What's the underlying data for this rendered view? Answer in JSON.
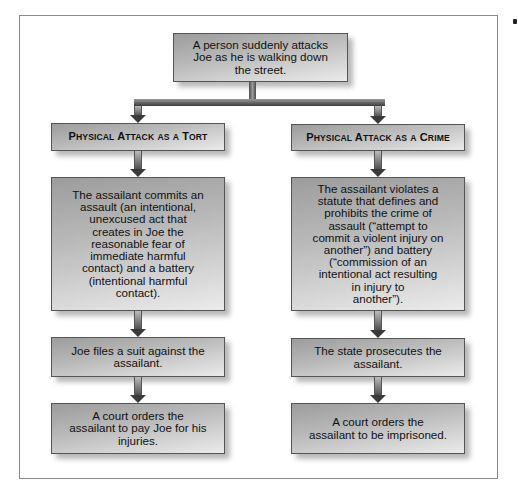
{
  "diagram": {
    "top": {
      "text": "A person suddenly attacks\nJoe as he is walking down\nthe street."
    },
    "columns": [
      {
        "id": "tort",
        "header": {
          "words": [
            {
              "cap": "P",
              "rest": "HYSICAL"
            },
            {
              "cap": "A",
              "rest": "TTACK"
            },
            {
              "cap": "",
              "rest": "AS"
            },
            {
              "cap": "",
              "rest": "A"
            },
            {
              "cap": "T",
              "rest": "ORT"
            }
          ],
          "label": "Physical Attack as a Tort"
        },
        "steps": [
          {
            "text": "The assailant commits an\nassault (an intentional,\nunexcused act that\ncreates in Joe the\nreasonable fear of\nimmediate harmful\ncontact) and a battery\n(intentional harmful\ncontact)."
          },
          {
            "text": "Joe files a suit against the\nassailant."
          },
          {
            "text": "A court orders the\nassailant to pay Joe for his\ninjuries."
          }
        ]
      },
      {
        "id": "crime",
        "header": {
          "words": [
            {
              "cap": "P",
              "rest": "HYSICAL"
            },
            {
              "cap": "A",
              "rest": "TTACK"
            },
            {
              "cap": "",
              "rest": "AS"
            },
            {
              "cap": "",
              "rest": "A"
            },
            {
              "cap": "C",
              "rest": "RIME"
            }
          ],
          "label": "Physical Attack as a Crime"
        },
        "steps": [
          {
            "text": "The assailant violates a\nstatute that defines and\nprohibits the crime of\nassault (“attempt to\ncommit a violent injury on\nanother”) and battery\n(“commission of an\nintentional act resulting\nin injury to\nanother”)."
          },
          {
            "text": "The state prosecutes the\nassailant."
          },
          {
            "text": "A court orders the\nassailant to be imprisoned."
          }
        ]
      }
    ]
  },
  "colors": {
    "frame_border": "#8a8a8a",
    "box_border": "#555555",
    "box_gradient_dark": "#9c9c9c",
    "box_gradient_light": "#ebebeb",
    "arrow_dark": "#3a3a3a",
    "text": "#111111"
  }
}
